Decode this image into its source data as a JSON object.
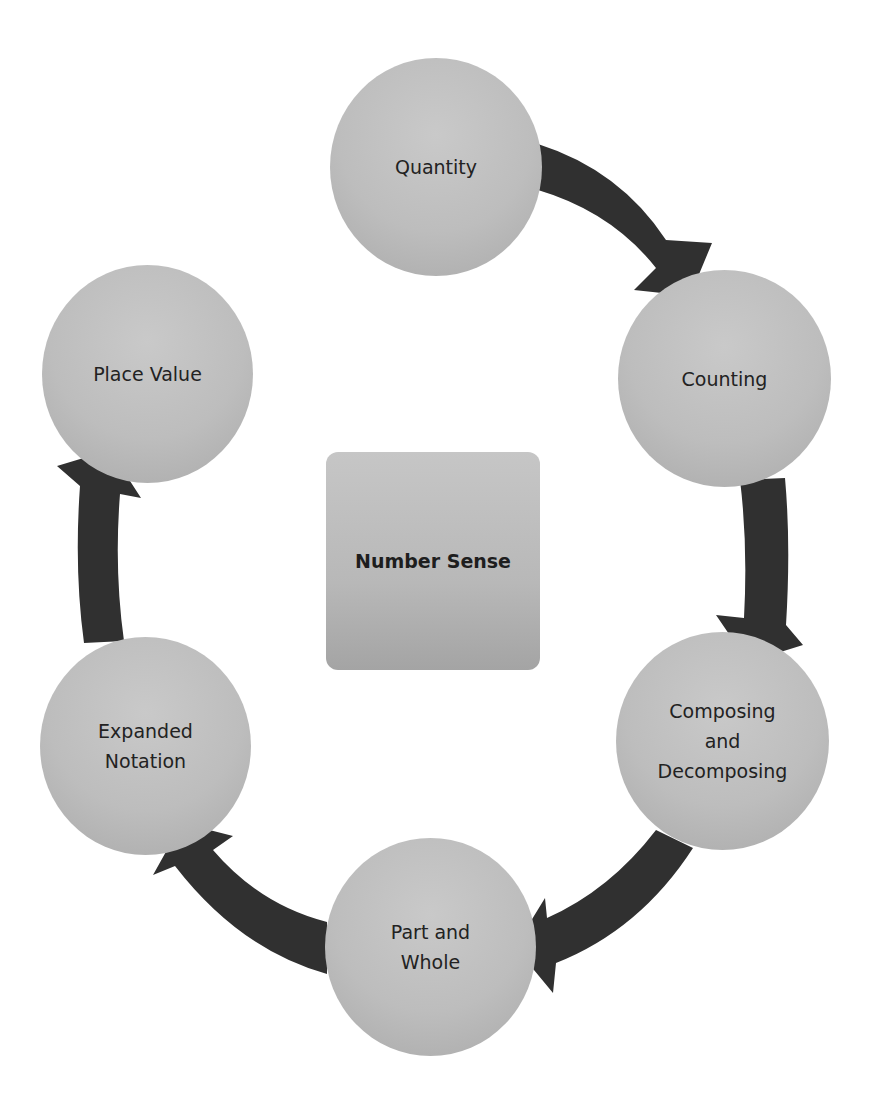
{
  "diagram": {
    "type": "cycle",
    "center": {
      "lines": [
        "Number",
        "Sense"
      ]
    },
    "nodes": [
      {
        "id": "quantity",
        "lines": [
          "Quantity"
        ]
      },
      {
        "id": "counting",
        "lines": [
          "Counting"
        ]
      },
      {
        "id": "composing",
        "lines": [
          "Composing",
          "and",
          "Decomposing"
        ]
      },
      {
        "id": "part-whole",
        "lines": [
          "Part and",
          "Whole"
        ]
      },
      {
        "id": "expanded",
        "lines": [
          "Expanded",
          "Notation"
        ]
      },
      {
        "id": "place-value",
        "lines": [
          "Place Value"
        ]
      }
    ],
    "edges": [
      {
        "from": "Quantity",
        "to": "Counting"
      },
      {
        "from": "Counting",
        "to": "Composing and Decomposing"
      },
      {
        "from": "Composing and Decomposing",
        "to": "Part and Whole"
      },
      {
        "from": "Part and Whole",
        "to": "Expanded Notation"
      },
      {
        "from": "Expanded Notation",
        "to": "Place Value"
      }
    ],
    "colors": {
      "node_fill": "#bdbdbd",
      "arrow_fill": "#303030",
      "text": "#222222",
      "background": "#ffffff"
    }
  }
}
